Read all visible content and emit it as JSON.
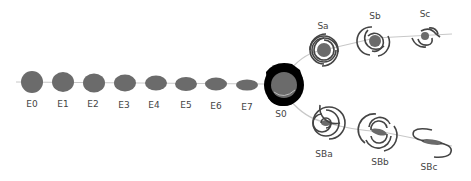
{
  "diagram": {
    "type": "hubble-tuning-fork",
    "colors": {
      "galaxy_fill": "#6b6b6b",
      "arm_stroke": "#444444",
      "axis_line": "#c8c8c8",
      "s0_ring": "#000000"
    },
    "ellipticals": [
      {
        "label": "E0"
      },
      {
        "label": "E1"
      },
      {
        "label": "E2"
      },
      {
        "label": "E3"
      },
      {
        "label": "E4"
      },
      {
        "label": "E5"
      },
      {
        "label": "E6"
      },
      {
        "label": "E7"
      }
    ],
    "lenticular": {
      "label": "S0"
    },
    "spirals": [
      {
        "label": "Sa"
      },
      {
        "label": "Sb"
      },
      {
        "label": "Sc"
      }
    ],
    "barred_spirals": [
      {
        "label": "SBa"
      },
      {
        "label": "SBb"
      },
      {
        "label": "SBc"
      }
    ]
  }
}
